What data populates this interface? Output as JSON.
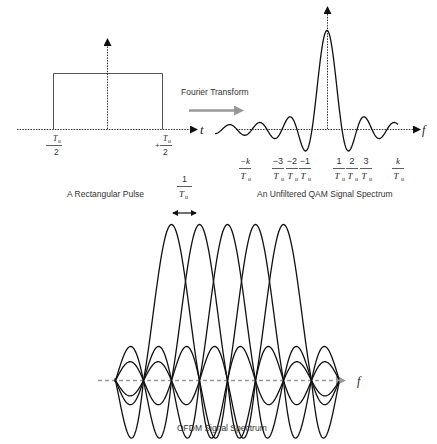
{
  "diagram": {
    "rect_pulse": {
      "caption": "A Rectangular Pulse",
      "axis_label": "t",
      "left_tick": {
        "numerator": "T",
        "sub": "u",
        "denominator": "2",
        "sign": "-"
      },
      "right_tick": {
        "numerator": "T",
        "sub": "u",
        "denominator": "2",
        "sign": "+"
      }
    },
    "transform": {
      "label": "Fourier Transform",
      "arrow_color": "#999999"
    },
    "qam_spectrum": {
      "caption": "An Unfiltered QAM Signal Spectrum",
      "axis_label": "f",
      "ticks": [
        {
          "num": "−k",
          "den": "T",
          "sub": "u"
        },
        {
          "num": "−3",
          "den": "T",
          "sub": "u"
        },
        {
          "num": "−2",
          "den": "T",
          "sub": "u"
        },
        {
          "num": "−1",
          "den": "T",
          "sub": "u"
        },
        {
          "num": "1",
          "den": "T",
          "sub": "u"
        },
        {
          "num": "2",
          "den": "T",
          "sub": "u"
        },
        {
          "num": "3",
          "den": "T",
          "sub": "u"
        },
        {
          "num": "k",
          "den": "T",
          "sub": "u"
        }
      ]
    },
    "ofdm_spectrum": {
      "caption": "OFDM Signal Spectrum",
      "axis_label": "f",
      "spacing_label": {
        "num": "1",
        "den": "T",
        "sub": "u"
      },
      "subcarrier_count": 5,
      "axis_color": "#999999"
    },
    "line_color": "#111111"
  }
}
